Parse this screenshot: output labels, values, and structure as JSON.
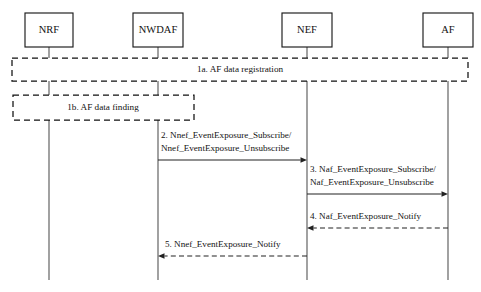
{
  "diagram": {
    "type": "sequence-diagram",
    "canvas": {
      "width": 481,
      "height": 292
    },
    "colors": {
      "background": "#ffffff",
      "box_stroke": "#1a1a1a",
      "lifeline_stroke": "#555555",
      "message_stroke": "#222222",
      "text": "#111111"
    },
    "actors": [
      {
        "id": "nrf",
        "label": "NRF",
        "x": 49,
        "box_x": 25,
        "box_y": 13,
        "box_w": 48,
        "box_h": 34
      },
      {
        "id": "nwdaf",
        "label": "NWDAF",
        "x": 158,
        "box_x": 133,
        "box_y": 13,
        "box_w": 50,
        "box_h": 34
      },
      {
        "id": "nef",
        "label": "NEF",
        "x": 307,
        "box_x": 282,
        "box_y": 13,
        "box_w": 50,
        "box_h": 34
      },
      {
        "id": "af",
        "label": "AF",
        "x": 448,
        "box_x": 423,
        "box_y": 13,
        "box_w": 50,
        "box_h": 34
      }
    ],
    "lifelines": {
      "top_y": 47,
      "bottom_y": 280
    },
    "phase_boxes": [
      {
        "id": "phase-1a",
        "label": "1a. AF data registration",
        "x": 12,
        "y": 58,
        "width": 456,
        "height": 23,
        "label_x": 240,
        "label_y": 70,
        "style": "dashed"
      },
      {
        "id": "phase-1b",
        "label": "1b. AF data finding",
        "x": 13,
        "y": 95,
        "width": 181,
        "height": 25,
        "label_x": 103,
        "label_y": 108,
        "style": "dashed"
      }
    ],
    "messages": [
      {
        "id": "msg-2",
        "number": "2",
        "from": "nwdaf",
        "to": "nef",
        "x1": 158,
        "x2": 307,
        "y": 160,
        "direction": "right",
        "style": "solid",
        "lines": [
          "2. Nnef_EventExposure_Subscribe/",
          "Nnef_EventExposure_Unsubscribe"
        ],
        "label_x": 161,
        "label_y1": 136,
        "label_y2": 149
      },
      {
        "id": "msg-3",
        "number": "3",
        "from": "nef",
        "to": "af",
        "x1": 307,
        "x2": 448,
        "y": 194,
        "direction": "right",
        "style": "solid",
        "lines": [
          "3. Naf_EventExposure_Subscribe/",
          "Naf_EventExposure_Unsubscribe"
        ],
        "label_x": 310,
        "label_y1": 170,
        "label_y2": 183
      },
      {
        "id": "msg-4",
        "number": "4",
        "from": "af",
        "to": "nef",
        "x1": 448,
        "x2": 307,
        "y": 228,
        "direction": "left",
        "style": "dashed",
        "lines": [
          "4. Naf_EventExposure_Notify"
        ],
        "label_x": 310,
        "label_y1": 217,
        "label_y2": null
      },
      {
        "id": "msg-5",
        "number": "5",
        "from": "nef",
        "to": "nwdaf",
        "x1": 307,
        "x2": 158,
        "y": 256,
        "direction": "left",
        "style": "dashed",
        "lines": [
          "5. Nnef_EventExposure_Notify"
        ],
        "label_x": 165,
        "label_y1": 245,
        "label_y2": null
      }
    ]
  }
}
